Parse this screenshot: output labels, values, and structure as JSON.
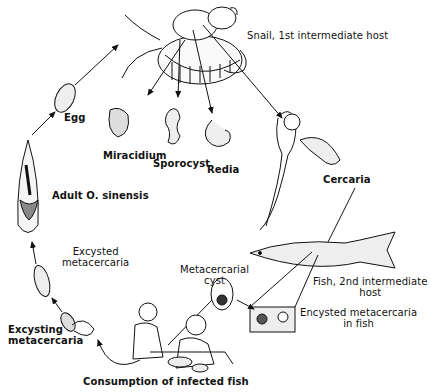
{
  "diagram": {
    "stages": [
      {
        "id": "snail",
        "label": "Snail, 1st intermediate host"
      },
      {
        "id": "egg",
        "label": "Egg"
      },
      {
        "id": "miracidium",
        "label": "Miracidium"
      },
      {
        "id": "sporocyst",
        "label": "Sporocyst"
      },
      {
        "id": "redia",
        "label": "Redia"
      },
      {
        "id": "cercaria",
        "label": "Cercaria"
      },
      {
        "id": "fish",
        "label_line1": "Fish, 2nd intermediate",
        "label_line2": "host"
      },
      {
        "id": "encysted",
        "label_line1": "Encysted metacercaria",
        "label_line2": "in fish"
      },
      {
        "id": "cyst",
        "label_line1": "Metacercarial",
        "label_line2": "cyst"
      },
      {
        "id": "consumption",
        "label": "Consumption of infected fish"
      },
      {
        "id": "excysting",
        "label_line1": "Excysting",
        "label_line2": "metacercaria"
      },
      {
        "id": "excysted",
        "label_line1": "Excysted",
        "label_line2": "metacercaria"
      },
      {
        "id": "adult",
        "label": "Adult O. sinensis"
      }
    ],
    "colors": {
      "line": "#111111",
      "background": "#ffffff"
    }
  }
}
